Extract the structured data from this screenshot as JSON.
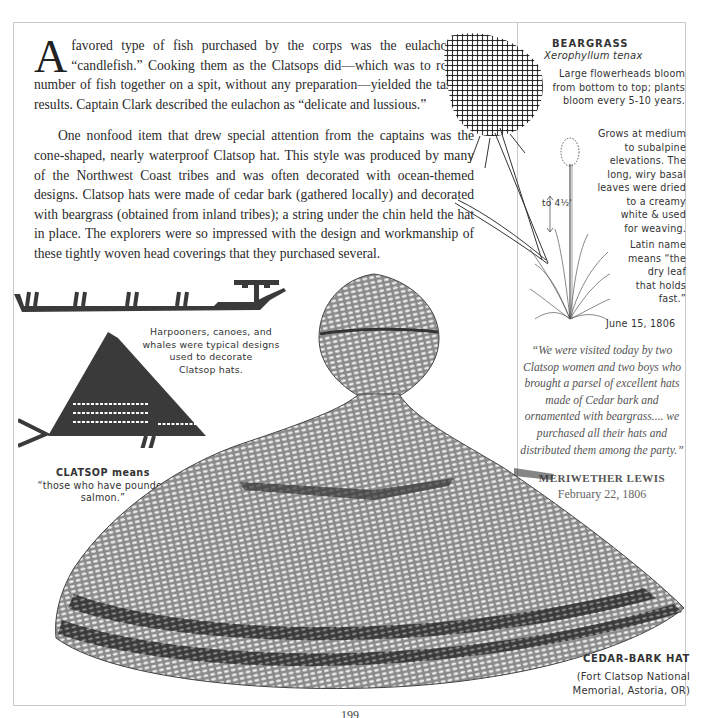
{
  "article": {
    "dropcap": "A",
    "paragraph1": "favored type of fish purchased by the corps was the eulachon or “candlefish.” Cooking them as the Clatsops did—which was to roast a number of fish together on a spit, without any preparation—yielded the tastiest results. Captain Clark described the eulachon as “delicate and lussious.”",
    "paragraph2": "One nonfood item that drew special attention from the captains was the cone-shaped, nearly waterproof Clatsop hat. This style was produced by many of the Northwest Coast tribes and was often decorated with ocean-themed designs. Clatsop hats were made of cedar bark (gathered locally) and decorated with beargrass (obtained from inland tribes); a string under the chin held the hat in place. The explorers were so impressed with the design and workmanship of these tightly woven head coverings that they purchased several."
  },
  "sidebar": {
    "title": "BEARGRASS",
    "scientific_name": "Xerophyllum tenax",
    "notes": {
      "flowerheads": [
        "Large flowerheads bloom",
        "from bottom to top; plants",
        "bloom every 5-10 years."
      ],
      "habitat": [
        "Grows at medium",
        "to subalpine",
        "elevations. The",
        "long, wiry basal",
        "leaves were dried",
        "to a creamy",
        "white & used",
        "for weaving."
      ],
      "height": "to 4½'",
      "latin": [
        "Latin name",
        "means “the",
        "dry leaf",
        "that holds",
        "fast.”"
      ],
      "date": "June 15, 1806"
    },
    "quote": {
      "text": "“We were visited today by two Clatsop women and two boys who brought a parsel of excellent hats made of Cedar bark and ornamented with beargrass.... we purchased all their hats and distributed them among the party.”",
      "author": "MERIWETHER LEWIS",
      "date": "February 22, 1806"
    }
  },
  "captions": {
    "designs": [
      "Harpooners, canoes, and",
      "whales were typical designs",
      "used to decorate",
      "Clatsop hats."
    ],
    "clatsop_title": "CLATSOP means",
    "clatsop_meaning": "“those who have pounded salmon.”",
    "hat_title": "CEDAR-BARK HAT",
    "hat_location": [
      "(Fort Clatsop National",
      "Memorial, Astoria, OR)"
    ]
  },
  "illustrations": {
    "beargrass_plant": "beargrass-illustration",
    "canoe_design": "harpooners-canoe-design",
    "whale_design": "whale-design",
    "hat": "cedar-bark-hat-illustration"
  },
  "page_number": "199",
  "colors": {
    "ink": "#2a2a2a",
    "frame": "#c9c9c9",
    "quote_text": "#555555",
    "weave_dark": "#3a3a3a",
    "weave_light": "#9a9a9a"
  }
}
